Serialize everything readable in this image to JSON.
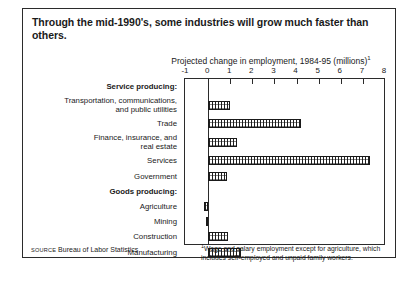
{
  "title": "Through the mid-1990's, some industries will grow much faster than others.",
  "axis_title_text": "Projected change in employment, 1984-95 (millions)",
  "axis_title_marker": "1",
  "source_prefix": "SOURCE",
  "source_text": "Bureau of Labor Statistics",
  "footnote_marker": "1",
  "footnote_text": "Wage and salary employment except for agriculture, which includes self-employed and unpaid family workers.",
  "chart_data": {
    "type": "bar",
    "orientation": "horizontal",
    "title": "Through the mid-1990's, some industries will grow much faster than others.",
    "xlabel": "Projected change in employment, 1984-95 (millions)",
    "ylabel": "",
    "xlim": [
      -1,
      8
    ],
    "xticks": [
      -1,
      0,
      1,
      2,
      3,
      4,
      5,
      6,
      7,
      8
    ],
    "xticklabels": [
      "-1",
      "0",
      "1",
      "2",
      "3",
      "4",
      "5",
      "6",
      "7",
      "8"
    ],
    "grid": false,
    "legend": "none",
    "rows": [
      {
        "label": "Service producing:",
        "is_header": true,
        "value": null
      },
      {
        "label": "Transportation, communications,\nand public utilities",
        "is_header": false,
        "value": 1.0
      },
      {
        "label": "Trade",
        "is_header": false,
        "value": 4.2
      },
      {
        "label": "Finance, insurance, and\nreal estate",
        "is_header": false,
        "value": 1.3
      },
      {
        "label": "Services",
        "is_header": false,
        "value": 7.3
      },
      {
        "label": "Government",
        "is_header": false,
        "value": 0.85
      },
      {
        "label": "Goods producing:",
        "is_header": true,
        "value": null
      },
      {
        "label": "Agriculture",
        "is_header": false,
        "value": -0.2
      },
      {
        "label": "Mining",
        "is_header": false,
        "value": -0.1
      },
      {
        "label": "Construction",
        "is_header": false,
        "value": 0.9
      },
      {
        "label": "Manufacturing",
        "is_header": false,
        "value": 1.5
      }
    ],
    "categories": [
      "Transportation, communications, and public utilities",
      "Trade",
      "Finance, insurance, and real estate",
      "Services",
      "Government",
      "Agriculture",
      "Mining",
      "Construction",
      "Manufacturing"
    ],
    "values": [
      1.0,
      4.2,
      1.3,
      7.3,
      0.85,
      -0.2,
      -0.1,
      0.9,
      1.5
    ]
  }
}
